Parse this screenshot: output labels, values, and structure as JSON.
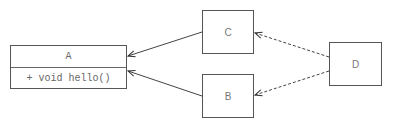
{
  "diagram": {
    "type": "uml-class-diagram",
    "colors": {
      "stroke": "#555555",
      "text": "#777777",
      "background": "#ffffff"
    },
    "nodes": {
      "A": {
        "name": "A",
        "methods": [
          "+ void hello()"
        ]
      },
      "B": {
        "name": "B"
      },
      "C": {
        "name": "C"
      },
      "D": {
        "name": "D"
      }
    },
    "edges": [
      {
        "from": "C",
        "to": "A",
        "style": "solid",
        "arrow": "open"
      },
      {
        "from": "B",
        "to": "A",
        "style": "solid",
        "arrow": "open"
      },
      {
        "from": "D",
        "to": "C",
        "style": "dashed",
        "arrow": "open"
      },
      {
        "from": "D",
        "to": "B",
        "style": "dashed",
        "arrow": "open"
      }
    ]
  }
}
